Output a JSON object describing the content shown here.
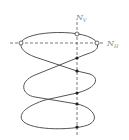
{
  "diagram": {
    "labels": {
      "vertical_axis": {
        "main": "N",
        "sub": "V"
      },
      "horizontal_axis": {
        "main": "N",
        "sub": "H"
      }
    },
    "colors": {
      "curve": "#555555",
      "axis": "#555555",
      "label": "#888888",
      "filled_point": "#222222",
      "open_point_fill": "#ffffff"
    },
    "open_points": [
      {
        "x": 77,
        "y": 34
      },
      {
        "x": 21,
        "y": 43
      },
      {
        "x": 97,
        "y": 43
      }
    ],
    "filled_points": [
      {
        "x": 77,
        "y": 58
      },
      {
        "x": 77,
        "y": 71
      },
      {
        "x": 77,
        "y": 93
      },
      {
        "x": 77,
        "y": 104
      },
      {
        "x": 77,
        "y": 127
      }
    ]
  }
}
